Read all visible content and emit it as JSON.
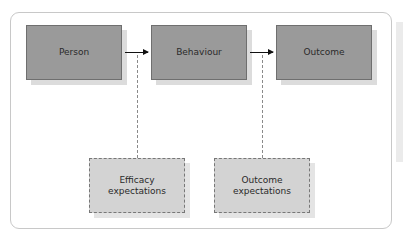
{
  "diagram": {
    "nodes": {
      "person": "Person",
      "behaviour": "Behaviour",
      "outcome": "Outcome",
      "efficacy_expectations": "Efficacy expectations",
      "outcome_expectations": "Outcome expectations"
    },
    "edges": [
      {
        "from": "Person",
        "to": "Behaviour",
        "style": "solid-arrow"
      },
      {
        "from": "Behaviour",
        "to": "Outcome",
        "style": "solid-arrow"
      },
      {
        "from": "Efficacy expectations",
        "to": "Person→Behaviour arrow",
        "style": "dashed"
      },
      {
        "from": "Outcome expectations",
        "to": "Behaviour→Outcome arrow",
        "style": "dashed"
      }
    ],
    "colors": {
      "solid_box_fill": "#9a9a9a",
      "dashed_box_fill": "#d3d3d3",
      "arrow": "#111111"
    }
  }
}
